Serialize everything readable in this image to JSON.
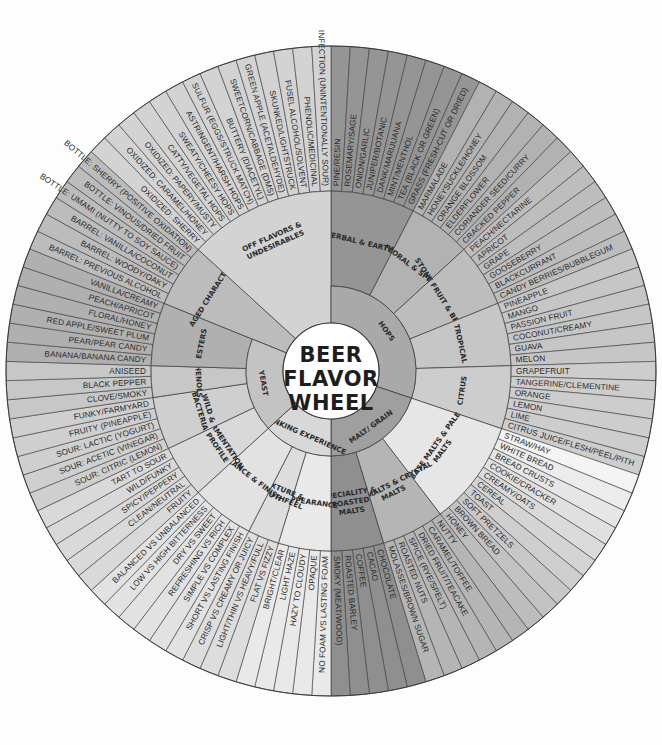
{
  "title": [
    "BEER",
    "FLAVOR",
    "WHEEL"
  ],
  "geometry": {
    "cx": 331,
    "cy": 371,
    "r_outer": 325,
    "r_mid": 180,
    "r_inner": 85,
    "r_center": 48,
    "start_angle_deg": 0
  },
  "colors": {
    "background": "#fdfdfd",
    "stroke": "#3a3a3a",
    "center_fill": "#ffffff"
  },
  "categories": [
    {
      "name": "HOPS",
      "color": "#a9a9a9",
      "subcategories": [
        {
          "name": "HERBAL & EARTHY",
          "color": "#959595",
          "items": [
            "PINE/RESIN",
            "ROSEMARY/SAGE",
            "ONION/GARLIC",
            "JUNIPER/BOTANIC",
            "DANK/MARIJUANA",
            "MINT/MENTHOL",
            "TEA (BLACK OR GREEN)",
            "GRASS (FRESH-CUT OR DRIED)"
          ]
        },
        {
          "name": "FLORAL & SPICE",
          "color": "#b2b2b2",
          "items": [
            "MARMALADE",
            "HONEYSUCKLE/HONEY",
            "ORANGE BLOSSOM",
            "ELDERFLOWER",
            "CORIANDER SEED/CURRY",
            "CRACKED PEPPER"
          ]
        },
        {
          "name": "STONE FRUIT & BERRIES",
          "color": "#bdbdbd",
          "items": [
            "PEACH/NECTARINE",
            "APRICOT",
            "GRAPE",
            "GOOSEBERRY",
            "BLACKCURRANT",
            "CANDY BERRIES/BUBBLEGUM"
          ]
        },
        {
          "name": "TROPICAL",
          "color": "#c6c6c6",
          "items": [
            "PINEAPPLE",
            "MANGO",
            "PASSION FRUIT",
            "COCONUT/CREAMY",
            "GUAVA",
            "MELON"
          ]
        },
        {
          "name": "CITRUS",
          "color": "#cdcdcd",
          "items": [
            "GRAPEFRUIT",
            "TANGERINE/CLEMENTINE",
            "ORANGE",
            "LEMON",
            "LIME",
            "CITRUS JUICE/FLESH/PEEL/PITH"
          ]
        }
      ]
    },
    {
      "name": "MALT/ GRAIN",
      "color": "#9f9f9f",
      "subcategories": [
        {
          "name": "BASE MALTS & PALE MALTS",
          "color": "#e6e6e6",
          "item_colors": [
            "#f4f4f4",
            "#ececec",
            "#e6e6e6",
            "#e0e0e0",
            "#dadada",
            "#d4d4d4",
            "#cecece",
            "#c8c8c8",
            "#c2c2c2",
            "#bdbdbd"
          ],
          "items": [
            "STRAW/HAY",
            "WHITE BREAD",
            "BREAD CRUSTS",
            "COOKIE/CRACKER",
            "CREAMY/OATS",
            "CEREAL",
            "TOAST",
            "SOFT PRETZELS",
            "BROWN BREAD",
            "HONEY"
          ]
        },
        {
          "name": "CARAMALTS & CRYSTAL MALTS",
          "color": "#b5b5b5",
          "items": [
            "NUTTY",
            "CARAMEL/TOFFEE",
            "DRIED FRUIT/TEACAKE",
            "SPICE (RYE/SPELT)",
            "ROASTED NUTS",
            "MOLASSES/BROWN SUGAR"
          ]
        },
        {
          "name": "SPECIALITY & ROASTED MALTS",
          "color": "#8f8f8f",
          "items": [
            "CHOCOLATE",
            "CACAO",
            "COFFEE",
            "ROASTED BARLEY",
            "SMOKY (MEAT/WOOD)"
          ]
        }
      ]
    },
    {
      "name": "DRINKING EXPERIENCE",
      "color": "#d8d8d8",
      "subcategories": [
        {
          "name": "APPEARANCE",
          "color": "#e9e9e9",
          "items": [
            "NO FOAM VS LASTING FOAM",
            "OPAQUE",
            "HAZY TO CLOUDY",
            "LIGHT HAZE",
            "BRIGHT/CLEAR"
          ]
        },
        {
          "name": "TEXTURE & MOUTHFEEL",
          "color": "#dddddd",
          "items": [
            "FLAT VS FIZZY",
            "LIGHT/THIN VS HEAVY/FULL",
            "CRISP VS CREAMY OR JUICY"
          ]
        },
        {
          "name": "BALANCE & FINISH",
          "color": "#e2e2e2",
          "items": [
            "SHORT VS LASTING FINISH",
            "SIMPLE VS COMPLEX",
            "REFRESHING VS RICH",
            "DRY VS SWEET",
            "LOW VS HIGH BITTERNESS",
            "BALANCED VS UNBALANCED"
          ]
        }
      ]
    },
    {
      "name": "YEAST",
      "color": "#c3c3c3",
      "subcategories": [
        {
          "name": "FERMENTATION PROFILE",
          "color": "#d9d9d9",
          "items": [
            "FRUITY",
            "CLEAN/NEUTRAL",
            "SPICY/PEPPERY",
            "WILD/FUNKY",
            "TART TO SOUR"
          ]
        },
        {
          "name": "WILD & BACTERIA",
          "color": "#cfcfcf",
          "items": [
            "SOUR: CITRIC (LEMON)",
            "SOUR: ACETIC (VINEGAR)",
            "SOUR: LACTIC (YOGURT)",
            "FRUITY (PINEAPPLE)",
            "FUNKY/FARMYARD"
          ]
        },
        {
          "name": "PHENOLS",
          "color": "#c7c7c7",
          "items": [
            "CLOVE/SMOKY",
            "BLACK PEPPER",
            "ANISEED"
          ]
        },
        {
          "name": "ESTERS",
          "color": "#b0b0b0",
          "items": [
            "BANANA/BANANA CANDY",
            "PEAR/PEAR CANDY",
            "RED APPLE/SWEET PLUM",
            "FLORAL/HONEY",
            "PEACH/APRICOT",
            "VANILLA/CREAMY"
          ]
        }
      ]
    },
    {
      "name": "AGED CHARACTER",
      "color": "#bcbcbc",
      "mid_span": true,
      "subcategories": [
        {
          "name": "AGED CHARACTER",
          "color": "#bcbcbc",
          "items": [
            "BARREL: PREVIOUS ALCOHOL",
            "BARREL: WOODY/OAKY",
            "BARREL: VANILLA/COCONUT",
            "BOTTLE: UMAMI (NUTTY TO SOY SAUCE)",
            "BOTTLE: VINOUS/DRIED FRUIT",
            "BOTTLE: SHERRY (POSITIVE OXIDATION)"
          ]
        }
      ]
    },
    {
      "name": "OFF FLAVORS & UNDESIRABLES",
      "color": "#d3d3d3",
      "mid_span": true,
      "subcategories": [
        {
          "name": "OFF FLAVORS & UNDESIRABLES",
          "color": "#d3d3d3",
          "items": [
            "OXIDIZED: SHERRY",
            "OXIDIZED: CARAMEL/HONEY",
            "OXIDIZED: PAPERY/MUSTY",
            "CATTY/VEGETAL HOPS",
            "SWEATY/CHEESY HOPS",
            "ASTRINGENT/HARSH HOPS",
            "SULFUR (EGGS/STRUCK MATCH)",
            "BUTTERY (DIACETYL)",
            "SWEETCORN/CABBAGE (DMS)",
            "GREEN APPLE (ACETALDEHYDE)",
            "SKUNKED/LIGHTSTRUCK",
            "FUSEL ALCOHOL/SOLVENT",
            "PHENOLIC/MEDICINAL",
            "INFECTION (UNINTENTIONALLY SOUR)"
          ]
        }
      ]
    }
  ]
}
